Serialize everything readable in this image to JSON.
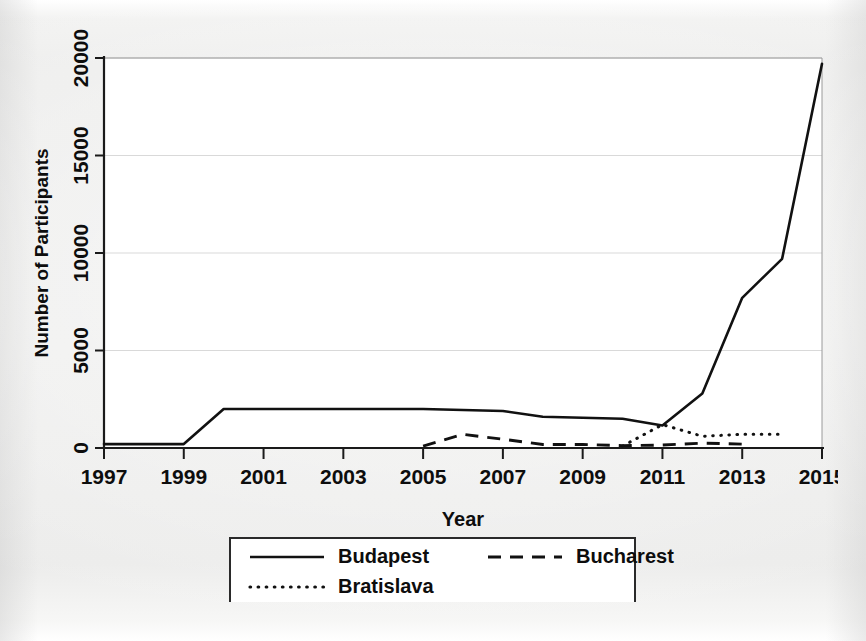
{
  "chart_data": {
    "type": "line",
    "title": "",
    "subtitle": "",
    "xlabel": "Year",
    "ylabel": "Number of Participants",
    "xlim": [
      1997,
      2015
    ],
    "ylim": [
      0,
      20000
    ],
    "grid": true,
    "legend_position": "bottom",
    "xticks": [
      "1997",
      "1999",
      "2001",
      "2003",
      "2005",
      "2007",
      "2009",
      "2011",
      "2013",
      "2015"
    ],
    "xtick_values": [
      1997,
      1999,
      2001,
      2003,
      2005,
      2007,
      2009,
      2011,
      2013,
      2015
    ],
    "yticks": [
      "0",
      "5000",
      "10000",
      "15000",
      "20000"
    ],
    "ytick_values": [
      0,
      5000,
      10000,
      15000,
      20000
    ],
    "series": [
      {
        "name": "Budapest",
        "style": "solid",
        "color": "#111111",
        "x": [
          1997,
          1998,
          1999,
          2000,
          2001,
          2002,
          2003,
          2004,
          2005,
          2006,
          2007,
          2008,
          2009,
          2010,
          2011,
          2012,
          2013,
          2014,
          2015
        ],
        "values": [
          200,
          200,
          200,
          2000,
          2000,
          2000,
          2000,
          2000,
          2000,
          1950,
          1900,
          1600,
          1550,
          1500,
          1150,
          2800,
          7700,
          9700,
          19700
        ]
      },
      {
        "name": "Bucharest",
        "style": "dashed",
        "color": "#111111",
        "x": [
          2005,
          2006,
          2007,
          2008,
          2009,
          2010,
          2011,
          2012,
          2013
        ],
        "values": [
          100,
          700,
          450,
          180,
          180,
          120,
          150,
          250,
          200
        ]
      },
      {
        "name": "Bratislava",
        "style": "dotted",
        "color": "#111111",
        "x": [
          2010,
          2011,
          2012,
          2013,
          2014
        ],
        "values": [
          100,
          1200,
          600,
          700,
          700
        ]
      }
    ],
    "annotations": []
  },
  "legend": {
    "entries": [
      {
        "label": "Budapest",
        "style": "solid"
      },
      {
        "label": "Bucharest",
        "style": "dashed"
      },
      {
        "label": "Bratislava",
        "style": "dotted"
      }
    ]
  }
}
